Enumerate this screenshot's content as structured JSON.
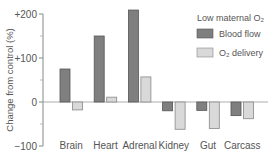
{
  "chart_data": {
    "type": "bar",
    "title": "",
    "xlabel": "",
    "ylabel": "Change from control (%)",
    "ylim": [
      -100,
      200
    ],
    "yticks": [
      {
        "value": 200,
        "label": "+200"
      },
      {
        "value": 100,
        "label": "+100"
      },
      {
        "value": 0,
        "label": "0"
      },
      {
        "value": -100,
        "label": "−100"
      }
    ],
    "minor_yticks": [
      150,
      50,
      -50
    ],
    "grid": false,
    "categories": [
      "Brain",
      "Heart",
      "Adrenal",
      "Kidney",
      "Gut",
      "Carcass"
    ],
    "series": [
      {
        "name": "Blood flow",
        "color": "#7f7f7f",
        "values": [
          75,
          150,
          209,
          -20,
          -19,
          -31
        ]
      },
      {
        "name": "O₂ delivery",
        "color": "#d9d9d9",
        "values": [
          -18,
          11,
          57,
          -62,
          -60,
          -38
        ]
      }
    ],
    "legend": {
      "title": "Low maternal O₂",
      "position": "upper right",
      "entries": [
        "Blood flow",
        "O₂ delivery"
      ]
    }
  }
}
